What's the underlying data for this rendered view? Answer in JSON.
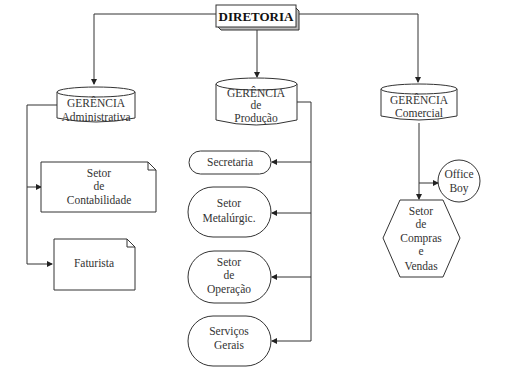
{
  "diagram": {
    "root": {
      "label": "DIRETORIA"
    },
    "managers": [
      {
        "line1": "GERÊNCIA",
        "line2": "Administrativa"
      },
      {
        "line1": "GERÊNCIA",
        "line2": "de",
        "line3": "Produção"
      },
      {
        "line1": "GERÊNCIA",
        "line2": "Comercial"
      }
    ],
    "admin_sectors": [
      {
        "lines": [
          "Setor",
          "de",
          "Contabilidade"
        ]
      },
      {
        "lines": [
          "Faturista"
        ]
      }
    ],
    "production_sectors": [
      {
        "lines": [
          "Secretaria"
        ]
      },
      {
        "lines": [
          "Setor",
          "Metalúrgic."
        ]
      },
      {
        "lines": [
          "Setor",
          "de",
          "Operação"
        ]
      },
      {
        "lines": [
          "Serviços",
          "Gerais"
        ]
      }
    ],
    "commercial_sectors": [
      {
        "lines": [
          "Office",
          "Boy"
        ],
        "shape": "circle"
      },
      {
        "lines": [
          "Setor",
          "de",
          "Compras",
          "e",
          "Vendas"
        ],
        "shape": "hexagon"
      }
    ]
  }
}
